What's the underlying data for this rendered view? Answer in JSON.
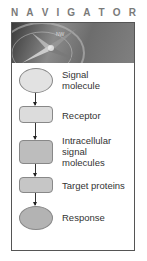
{
  "title": {
    "letters": [
      "N",
      "A",
      "V",
      "I",
      "G",
      "A",
      "T",
      "O",
      "R"
    ],
    "text": "NAVIGATOR"
  },
  "banner": {
    "icon": "compass-icon"
  },
  "steps": [
    {
      "label_lines": [
        "Signal",
        "molecule"
      ],
      "shape": "ellipse",
      "fill": "#e2e2e2"
    },
    {
      "label_lines": [
        "Receptor"
      ],
      "shape": "rounded-rect",
      "fill": "#dcdcdc"
    },
    {
      "label_lines": [
        "Intracellular",
        "signal",
        "molecules"
      ],
      "shape": "rounded-rect",
      "fill": "#bdbdbd"
    },
    {
      "label_lines": [
        "Target proteins"
      ],
      "shape": "rounded-rect",
      "fill": "#c6c6c6"
    },
    {
      "label_lines": [
        "Response"
      ],
      "shape": "ellipse",
      "fill": "#b3b3b3"
    }
  ],
  "colors": {
    "title": "#7a7a7a",
    "frame": "#555555",
    "text": "#333333",
    "arrow": "#222222"
  }
}
